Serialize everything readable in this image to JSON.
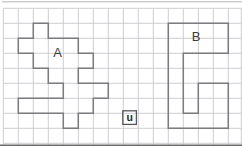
{
  "figure": {
    "width": 242,
    "height": 148,
    "background": "#ffffff",
    "grid": {
      "x0": 3.3,
      "y0": 8.3,
      "cell": 15,
      "vlines": 16,
      "hlines": 10,
      "edge_vline_x": 241.3,
      "h_span": [
        3.3,
        242
      ],
      "v_span": [
        8.3,
        145
      ],
      "color": "#c9c9cf",
      "stroke_width": 0.9
    },
    "border_top": {
      "y": 1.8,
      "x1": 2,
      "x2": 242,
      "color": "#b7b7bc",
      "stroke_width": 1
    },
    "border_bottom": {
      "y": 145.3,
      "x1": 0,
      "x2": 242,
      "color": "#6b6b70",
      "stroke_width": 1.6
    },
    "shapes": [
      {
        "name": "A",
        "label": "A",
        "label_x": 57.5,
        "label_y": 56.5,
        "stroke": "#7c7c80",
        "stroke_width": 1.5,
        "points": [
          [
            33.3,
            23.3
          ],
          [
            48.3,
            23.3
          ],
          [
            48.3,
            38.3
          ],
          [
            78.3,
            38.3
          ],
          [
            78.3,
            53.3
          ],
          [
            93.3,
            53.3
          ],
          [
            93.3,
            68.3
          ],
          [
            78.3,
            68.3
          ],
          [
            78.3,
            83.3
          ],
          [
            108.3,
            83.3
          ],
          [
            108.3,
            98.3
          ],
          [
            93.3,
            98.3
          ],
          [
            93.3,
            113.3
          ],
          [
            78.3,
            113.3
          ],
          [
            78.3,
            128.3
          ],
          [
            63.3,
            128.3
          ],
          [
            63.3,
            113.3
          ],
          [
            18.3,
            113.3
          ],
          [
            18.3,
            98.3
          ],
          [
            63.3,
            98.3
          ],
          [
            63.3,
            83.3
          ],
          [
            48.3,
            83.3
          ],
          [
            48.3,
            68.3
          ],
          [
            33.3,
            68.3
          ],
          [
            33.3,
            53.3
          ],
          [
            18.3,
            53.3
          ],
          [
            18.3,
            38.3
          ],
          [
            33.3,
            38.3
          ]
        ]
      },
      {
        "name": "B",
        "label": "B",
        "label_x": 196,
        "label_y": 40.5,
        "stroke": "#7c7c80",
        "stroke_width": 1.5,
        "points": [
          [
            168.3,
            23.3
          ],
          [
            228.3,
            23.3
          ],
          [
            228.3,
            53.3
          ],
          [
            183.3,
            53.3
          ],
          [
            183.3,
            113.3
          ],
          [
            198.3,
            113.3
          ],
          [
            198.3,
            83.3
          ],
          [
            228.3,
            83.3
          ],
          [
            228.3,
            128.3
          ],
          [
            168.3,
            128.3
          ]
        ]
      }
    ],
    "unit_square": {
      "label": "u",
      "x": 122.8,
      "y": 110.8,
      "size": 13.6,
      "stroke": "#56565b",
      "stroke_width": 1.3,
      "label_x": 129.6,
      "label_y": 120.6
    }
  }
}
